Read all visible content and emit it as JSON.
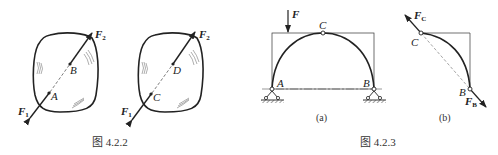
{
  "figure_4_2_2": {
    "caption": "图 4.2.2",
    "left_body": {
      "points": [
        "A",
        "B"
      ],
      "forces": [
        {
          "name": "F",
          "sub": "1"
        },
        {
          "name": "F",
          "sub": "2"
        }
      ]
    },
    "right_body": {
      "points": [
        "C",
        "D"
      ],
      "forces": [
        {
          "name": "F",
          "sub": "1"
        },
        {
          "name": "F",
          "sub": "2"
        }
      ]
    }
  },
  "figure_4_2_3": {
    "caption": "图 4.2.3",
    "panel_a": {
      "label": "(a)",
      "load": "F",
      "hinge_top": "C",
      "supports": [
        "A",
        "B"
      ]
    },
    "panel_b": {
      "label": "(b)",
      "points": [
        "C",
        "B"
      ],
      "forces": [
        {
          "name": "F",
          "sub": "C"
        },
        {
          "name": "F",
          "sub": "B"
        }
      ]
    }
  }
}
